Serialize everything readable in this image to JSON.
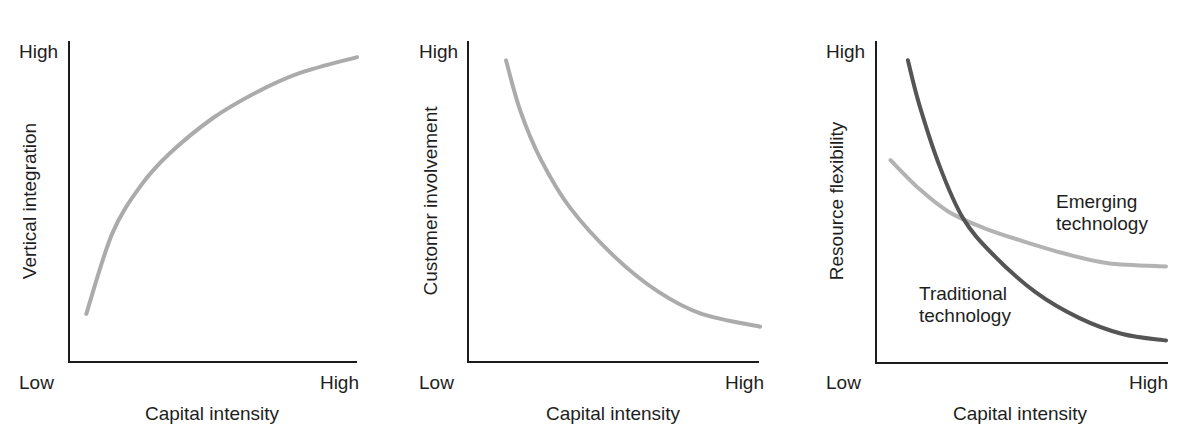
{
  "page_header": {
    "page_number": "",
    "running_title": ""
  },
  "chart_data": [
    {
      "type": "line",
      "title": "",
      "xlabel": "Capital intensity",
      "ylabel": "Vertical integration",
      "x_tick_labels": [
        "Low",
        "High"
      ],
      "y_tick_labels": [
        "High"
      ],
      "grid": false,
      "legend": "none",
      "xlim": [
        0,
        1
      ],
      "ylim": [
        0,
        1
      ],
      "series": [
        {
          "name": "Vertical integration",
          "color": "#ababab",
          "width": 4,
          "x": [
            0.06,
            0.15,
            0.25,
            0.35,
            0.5,
            0.65,
            0.8,
            1.0
          ],
          "y": [
            0.15,
            0.4,
            0.55,
            0.65,
            0.76,
            0.84,
            0.9,
            0.95
          ]
        }
      ],
      "layout": {
        "origin_x": 69,
        "origin_y": 362,
        "x_end": 357,
        "y_top": 41,
        "plot_x0": 69,
        "plot_x1": 357,
        "plot_y0": 362,
        "plot_y1": 41,
        "ylabel_cx": 29,
        "ylabel_cy": 201,
        "high_y_x": 19,
        "high_y_y": 58,
        "low_x": 19,
        "high_x_right": 359,
        "tick_y": 389,
        "xlabel_cx": 212,
        "xlabel_y": 420
      }
    },
    {
      "type": "line",
      "title": "",
      "xlabel": "Capital intensity",
      "ylabel": "Customer involvement",
      "x_tick_labels": [
        "Low",
        "High"
      ],
      "y_tick_labels": [
        "High"
      ],
      "grid": false,
      "legend": "none",
      "xlim": [
        0,
        1
      ],
      "ylim": [
        0,
        1
      ],
      "series": [
        {
          "name": "Customer involvement",
          "color": "#ababab",
          "width": 4,
          "x": [
            0.13,
            0.18,
            0.25,
            0.35,
            0.5,
            0.65,
            0.8,
            1.0
          ],
          "y": [
            0.94,
            0.78,
            0.63,
            0.48,
            0.33,
            0.22,
            0.15,
            0.11
          ]
        }
      ],
      "layout": {
        "origin_x": 468,
        "origin_y": 362,
        "x_end": 759,
        "y_top": 41,
        "plot_x0": 468,
        "plot_x1": 760,
        "plot_y0": 362,
        "plot_y1": 41,
        "ylabel_cx": 430,
        "ylabel_cy": 201,
        "high_y_x": 419,
        "high_y_y": 58,
        "low_x": 419,
        "high_x_right": 764,
        "tick_y": 389,
        "xlabel_cx": 613,
        "xlabel_y": 420
      }
    },
    {
      "type": "line",
      "title": "",
      "xlabel": "Capital intensity",
      "ylabel": "Resource flexibility",
      "x_tick_labels": [
        "Low",
        "High"
      ],
      "y_tick_labels": [
        "High"
      ],
      "grid": false,
      "legend": "direct-labels",
      "xlim": [
        0,
        1
      ],
      "ylim": [
        0,
        1
      ],
      "series": [
        {
          "name": "Traditional technology",
          "color": "#555555",
          "width": 4,
          "x": [
            0.11,
            0.15,
            0.22,
            0.3,
            0.4,
            0.55,
            0.7,
            0.85,
            1.0
          ],
          "y": [
            0.94,
            0.8,
            0.61,
            0.45,
            0.34,
            0.22,
            0.14,
            0.09,
            0.07
          ]
        },
        {
          "name": "Emerging technology",
          "color": "#b3b3b3",
          "width": 4,
          "x": [
            0.05,
            0.15,
            0.25,
            0.37,
            0.5,
            0.65,
            0.8,
            1.0
          ],
          "y": [
            0.63,
            0.54,
            0.47,
            0.42,
            0.38,
            0.34,
            0.31,
            0.3
          ]
        }
      ],
      "annotations": [
        {
          "text_lines": [
            "Emerging",
            "technology"
          ],
          "x": 1056,
          "y": 208
        },
        {
          "text_lines": [
            "Traditional",
            "technology"
          ],
          "x": 919,
          "y": 300
        }
      ],
      "layout": {
        "origin_x": 876,
        "origin_y": 363,
        "x_end": 1168,
        "y_top": 41,
        "plot_x0": 876,
        "plot_x1": 1166,
        "plot_y0": 363,
        "plot_y1": 41,
        "ylabel_cx": 836,
        "ylabel_cy": 201,
        "high_y_x": 826,
        "high_y_y": 58,
        "low_x": 826,
        "high_x_right": 1168,
        "tick_y": 389,
        "xlabel_cx": 1020,
        "xlabel_y": 420
      }
    }
  ]
}
